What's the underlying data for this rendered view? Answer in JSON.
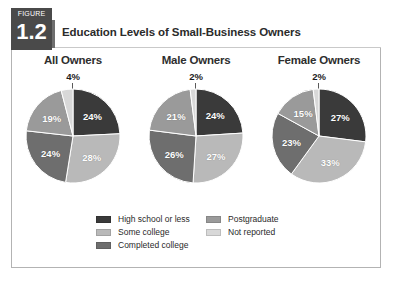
{
  "figure": {
    "tab_word": "FIGURE",
    "tab_number": "1.2",
    "title": "Education Levels of Small-Business Owners"
  },
  "colors": {
    "high_school": "#3a3a3a",
    "some_college": "#b9b9b9",
    "completed_college": "#6e6e6e",
    "postgraduate": "#9a9a9a",
    "not_reported": "#d8d8d8",
    "tab_background": "#4a4a4a",
    "frame_border": "#b3b3b3",
    "title_text": "#2b2b2b"
  },
  "legend": {
    "columns": [
      {
        "items": [
          {
            "label": "High school or less",
            "color_key": "high_school"
          },
          {
            "label": "Some college",
            "color_key": "some_college"
          },
          {
            "label": "Completed college",
            "color_key": "completed_college"
          }
        ]
      },
      {
        "items": [
          {
            "label": "Postgraduate",
            "color_key": "postgraduate"
          },
          {
            "label": "Not reported",
            "color_key": "not_reported"
          }
        ]
      }
    ]
  },
  "chart_data": {
    "type": "pie",
    "title": "Education Levels of Small-Business Owners",
    "categories": [
      "High school or less",
      "Some college",
      "Completed college",
      "Postgraduate",
      "Not reported"
    ],
    "category_colors": [
      "#3a3a3a",
      "#b9b9b9",
      "#6e6e6e",
      "#9a9a9a",
      "#d8d8d8"
    ],
    "unit": "%",
    "legend_position": "bottom",
    "grid": false,
    "charts": [
      {
        "title": "All Owners",
        "values": [
          24,
          28,
          24,
          19,
          4
        ],
        "labels": [
          "24%",
          "28%",
          "24%",
          "19%",
          "4%"
        ],
        "outside_label": "4%",
        "outside_label_index": 4
      },
      {
        "title": "Male Owners",
        "values": [
          24,
          27,
          26,
          21,
          2
        ],
        "labels": [
          "24%",
          "27%",
          "26%",
          "21%",
          "2%"
        ],
        "outside_label": "2%",
        "outside_label_index": 4
      },
      {
        "title": "Female Owners",
        "values": [
          27,
          33,
          23,
          15,
          2
        ],
        "labels": [
          "27%",
          "33%",
          "23%",
          "15%",
          "2%"
        ],
        "outside_label": "2%",
        "outside_label_index": 4
      }
    ]
  }
}
